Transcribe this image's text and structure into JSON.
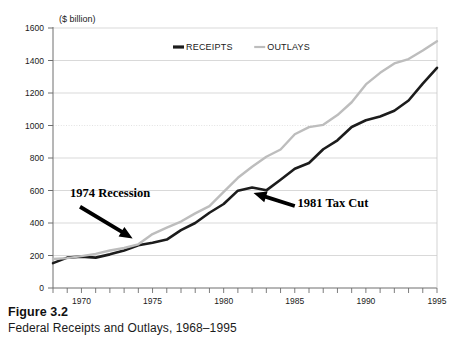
{
  "figure": {
    "number_label": "Figure 3.2",
    "caption": "Federal Receipts and Outlays, 1968–1995"
  },
  "colors": {
    "receipts": "#1c1c1c",
    "outlays": "#bdbdbd",
    "axis": "#6e6e6e",
    "grid": "#c8c8c8",
    "grid_faint": "#e2e2e2",
    "text": "#1a1a1a",
    "background": "#ffffff"
  },
  "chart_data": {
    "type": "line",
    "title": "",
    "subtitle": "",
    "xlabel": "",
    "ylabel": "($ billion)",
    "unit_label": "($ billion)",
    "grid": true,
    "legend_position": "top-center",
    "xlim": [
      1968,
      1995
    ],
    "ylim": [
      0,
      1600
    ],
    "y_ticks": [
      0,
      200,
      400,
      600,
      800,
      1000,
      1200,
      1400,
      1600
    ],
    "y_tick_labels": [
      "0",
      "200",
      "400",
      "600",
      "800",
      "1000",
      "1200",
      "1400",
      "1600"
    ],
    "x_ticks": [
      1968,
      1969,
      1970,
      1971,
      1972,
      1973,
      1974,
      1975,
      1976,
      1977,
      1978,
      1979,
      1980,
      1981,
      1982,
      1983,
      1984,
      1985,
      1986,
      1987,
      1988,
      1989,
      1990,
      1991,
      1992,
      1993,
      1994,
      1995
    ],
    "x_tick_labels": [
      "1970",
      "1975",
      "1980",
      "1985",
      "1990",
      "1995"
    ],
    "x_labeled_ticks": [
      1970,
      1975,
      1980,
      1985,
      1990,
      1995
    ],
    "x": [
      1968,
      1969,
      1970,
      1971,
      1972,
      1973,
      1974,
      1975,
      1976,
      1977,
      1978,
      1979,
      1980,
      1981,
      1982,
      1983,
      1984,
      1985,
      1986,
      1987,
      1988,
      1989,
      1990,
      1991,
      1992,
      1993,
      1994,
      1995
    ],
    "series": [
      {
        "name": "RECEIPTS",
        "color": "#1c1c1c",
        "values": [
          153,
          187,
          193,
          187,
          207,
          231,
          263,
          279,
          298,
          356,
          400,
          463,
          517,
          599,
          618,
          601,
          666,
          734,
          769,
          854,
          909,
          991,
          1032,
          1055,
          1091,
          1154,
          1258,
          1355
        ]
      },
      {
        "name": "OUTLAYS",
        "color": "#bdbdbd",
        "values": [
          178,
          184,
          196,
          210,
          231,
          246,
          269,
          332,
          372,
          409,
          459,
          504,
          591,
          678,
          746,
          808,
          852,
          946,
          990,
          1004,
          1064,
          1143,
          1253,
          1324,
          1382,
          1409,
          1461,
          1519
        ]
      }
    ],
    "annotations": [
      {
        "id": "recession-1974",
        "text": "1974 Recession",
        "text_x": 1969.2,
        "text_y": 560,
        "arrow_from_x": 1969.9,
        "arrow_from_y": 500,
        "arrow_to_x": 1973.6,
        "arrow_to_y": 305
      },
      {
        "id": "tax-cut-1981",
        "text": "1981 Tax Cut",
        "text_x": 1985.2,
        "text_y": 500,
        "arrow_from_x": 1985.0,
        "arrow_from_y": 505,
        "arrow_to_x": 1982.1,
        "arrow_to_y": 585
      }
    ]
  }
}
